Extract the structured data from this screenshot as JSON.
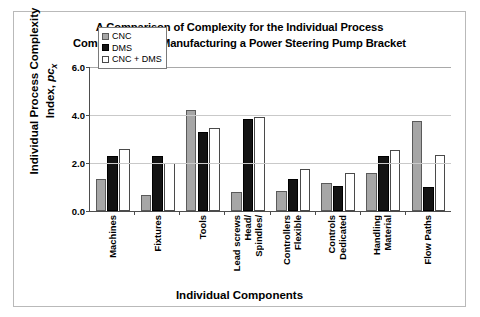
{
  "chart_data": {
    "type": "bar",
    "title": "A Comparison of Complexity for the Individual Process Components for Manufacturing a Power Steering Pump Bracket",
    "title_lines": [
      "A Comparison of Complexity for the Individual Process",
      "Components for Manufacturing a Power Steering Pump Bracket"
    ],
    "xlabel": "Individual Components",
    "ylabel": "Individual Process Complexity Index,",
    "ylabel_symbol": "pc",
    "ylabel_symbol_sub": "x",
    "ylim": [
      0.0,
      6.0
    ],
    "yticks": [
      0.0,
      2.0,
      4.0,
      6.0
    ],
    "ytick_labels": [
      "0.0",
      "2.0",
      "4.0",
      "6.0"
    ],
    "grid": true,
    "legend_position": "top-left-inside",
    "categories": [
      "Machines",
      "Fixtures",
      "Tools",
      "Spindles/ Head/ Lead screws",
      "Flexible Controllers",
      "Dedicated Controls",
      "Material Handling",
      "Flow Paths"
    ],
    "category_lines": [
      [
        "Machines"
      ],
      [
        "Fixtures"
      ],
      [
        "Tools"
      ],
      [
        "Spindles/",
        "Head/",
        "Lead screws"
      ],
      [
        "Flexible",
        "Controllers"
      ],
      [
        "Dedicated",
        "Controls"
      ],
      [
        "Material",
        "Handling"
      ],
      [
        "Flow Paths"
      ]
    ],
    "series": [
      {
        "name": "CNC",
        "color": "#a6a6a6",
        "values": [
          1.35,
          0.65,
          4.2,
          0.8,
          0.85,
          1.15,
          1.6,
          3.75
        ]
      },
      {
        "name": "DMS",
        "color": "#131313",
        "values": [
          2.3,
          2.3,
          3.3,
          3.85,
          1.35,
          1.05,
          2.3,
          1.0
        ]
      },
      {
        "name": "CNC + DMS",
        "color": "#ffffff",
        "values": [
          2.6,
          2.0,
          3.45,
          3.9,
          1.75,
          1.6,
          2.55,
          2.35
        ]
      }
    ]
  }
}
